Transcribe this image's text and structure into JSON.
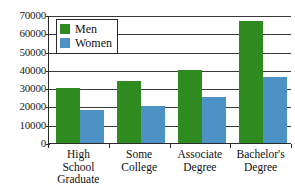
{
  "chart_data": {
    "type": "bar",
    "title": "",
    "subtitle": "",
    "xlabel": "",
    "ylabel": "",
    "categories": [
      "High School Graduate",
      "Some College",
      "Associate Degree",
      "Bachelor's Degree"
    ],
    "category_lines": [
      [
        "High",
        "School",
        "Graduate"
      ],
      [
        "Some",
        "College"
      ],
      [
        "Associate",
        "Degree"
      ],
      [
        "Bachelor's",
        "Degree"
      ]
    ],
    "series": [
      {
        "name": "Men",
        "color": "#2f8a1f",
        "values": [
          30000,
          34000,
          40000,
          66500
        ]
      },
      {
        "name": "Women",
        "color": "#4d92c4",
        "values": [
          18000,
          20000,
          25000,
          36000
        ]
      }
    ],
    "ylim": [
      0,
      70000
    ],
    "yticks": [
      0,
      10000,
      20000,
      30000,
      40000,
      50000,
      60000,
      70000
    ],
    "ytick_labels": [
      "0",
      "10000",
      "20000",
      "30000",
      "40000",
      "50000",
      "60000",
      "70000"
    ],
    "grid": true,
    "grid_axis": "y",
    "legend": {
      "position": "upper-left-inside",
      "entries": [
        {
          "label": "Men",
          "color": "#2f8a1f",
          "swatch": "green-square-icon"
        },
        {
          "label": "Women",
          "color": "#4d92c4",
          "swatch": "blue-square-icon"
        }
      ]
    },
    "axis_color": "#2b2b2b",
    "background": "#ffffff"
  }
}
